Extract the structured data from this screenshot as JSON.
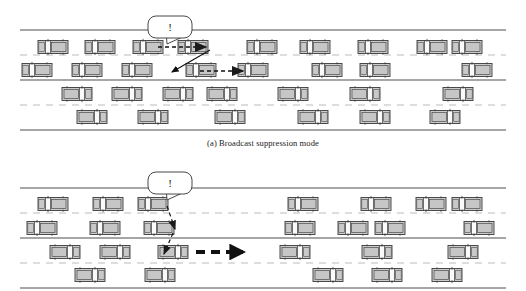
{
  "figure": {
    "background_color": "#ffffff",
    "width": 526,
    "height": 291
  },
  "captions": {
    "panel_a": "(a) Broadcast suppression mode",
    "panel_b": ""
  },
  "bubble": {
    "label": "!",
    "name": "alert-speech-bubble",
    "fill": "#ffffff",
    "stroke": "#333333"
  },
  "colors": {
    "road_line": "#888888",
    "lane_dash": "#bbbbbb",
    "car_body": "#cccccc",
    "car_stroke": "#3a3a3a",
    "car_window": "#f6f6f6",
    "arrow_dark": "#111111",
    "arrow_mid": "#2a2a2a",
    "caption_text": "#1a1a1a"
  },
  "panels": [
    {
      "id": "panel-a",
      "name": "broadcast-suppression-panel",
      "caption": "(a) Broadcast suppression mode",
      "road": {
        "x": 20,
        "y": 30,
        "width": 486,
        "height": 100,
        "lanes": 4
      },
      "lane_y": [
        47,
        70,
        94,
        117
      ],
      "lane_direction": [
        "left",
        "left",
        "right",
        "right"
      ],
      "cars": [
        {
          "lane": 0,
          "x": 38,
          "dir": "left"
        },
        {
          "lane": 0,
          "x": 85,
          "dir": "left"
        },
        {
          "lane": 0,
          "x": 133,
          "dir": "left"
        },
        {
          "lane": 0,
          "x": 178,
          "dir": "left"
        },
        {
          "lane": 0,
          "x": 247,
          "dir": "left"
        },
        {
          "lane": 0,
          "x": 300,
          "dir": "left"
        },
        {
          "lane": 0,
          "x": 358,
          "dir": "left"
        },
        {
          "lane": 0,
          "x": 417,
          "dir": "left"
        },
        {
          "lane": 0,
          "x": 452,
          "dir": "left"
        },
        {
          "lane": 1,
          "x": 22,
          "dir": "left"
        },
        {
          "lane": 1,
          "x": 72,
          "dir": "left"
        },
        {
          "lane": 1,
          "x": 122,
          "dir": "left"
        },
        {
          "lane": 1,
          "x": 186,
          "dir": "left"
        },
        {
          "lane": 1,
          "x": 238,
          "dir": "left"
        },
        {
          "lane": 1,
          "x": 312,
          "dir": "left"
        },
        {
          "lane": 1,
          "x": 360,
          "dir": "left"
        },
        {
          "lane": 1,
          "x": 462,
          "dir": "left"
        },
        {
          "lane": 2,
          "x": 62,
          "dir": "right"
        },
        {
          "lane": 2,
          "x": 112,
          "dir": "right"
        },
        {
          "lane": 2,
          "x": 163,
          "dir": "right"
        },
        {
          "lane": 2,
          "x": 207,
          "dir": "right"
        },
        {
          "lane": 2,
          "x": 278,
          "dir": "right"
        },
        {
          "lane": 2,
          "x": 350,
          "dir": "right"
        },
        {
          "lane": 2,
          "x": 443,
          "dir": "right"
        },
        {
          "lane": 3,
          "x": 77,
          "dir": "right"
        },
        {
          "lane": 3,
          "x": 138,
          "dir": "right"
        },
        {
          "lane": 3,
          "x": 215,
          "dir": "right"
        },
        {
          "lane": 3,
          "x": 298,
          "dir": "right"
        },
        {
          "lane": 3,
          "x": 360,
          "dir": "right"
        },
        {
          "lane": 3,
          "x": 430,
          "dir": "right"
        }
      ],
      "bubble": {
        "x": 148,
        "y": 16,
        "width": 44,
        "height": 22,
        "tail_x": 167,
        "tail_y": 44
      },
      "arrows": [
        {
          "name": "broadcast-arrow-horizontal",
          "type": "dashed",
          "x1": 158,
          "y1": 47,
          "x2": 206,
          "y2": 47,
          "weight": 1.6
        },
        {
          "name": "broadcast-arrow-diagonal",
          "type": "solid",
          "x1": 210,
          "y1": 50,
          "x2": 172,
          "y2": 72,
          "weight": 1.1
        },
        {
          "name": "relay-arrow-horizontal",
          "type": "dashed",
          "x1": 200,
          "y1": 71,
          "x2": 243,
          "y2": 71,
          "weight": 1.6
        }
      ]
    },
    {
      "id": "panel-b",
      "name": "multihop-relay-panel",
      "caption": "",
      "road": {
        "x": 20,
        "y": 188,
        "width": 486,
        "height": 100,
        "lanes": 4
      },
      "lane_y": [
        204,
        228,
        252,
        275
      ],
      "lane_direction": [
        "left",
        "left",
        "right",
        "right"
      ],
      "cars": [
        {
          "lane": 0,
          "x": 38,
          "dir": "left"
        },
        {
          "lane": 0,
          "x": 93,
          "dir": "left"
        },
        {
          "lane": 0,
          "x": 138,
          "dir": "left"
        },
        {
          "lane": 0,
          "x": 288,
          "dir": "left"
        },
        {
          "lane": 0,
          "x": 361,
          "dir": "left"
        },
        {
          "lane": 0,
          "x": 416,
          "dir": "left"
        },
        {
          "lane": 0,
          "x": 452,
          "dir": "left"
        },
        {
          "lane": 1,
          "x": 27,
          "dir": "left"
        },
        {
          "lane": 1,
          "x": 90,
          "dir": "left"
        },
        {
          "lane": 1,
          "x": 144,
          "dir": "left"
        },
        {
          "lane": 1,
          "x": 285,
          "dir": "left"
        },
        {
          "lane": 1,
          "x": 338,
          "dir": "left"
        },
        {
          "lane": 1,
          "x": 375,
          "dir": "left"
        },
        {
          "lane": 1,
          "x": 464,
          "dir": "left"
        },
        {
          "lane": 2,
          "x": 50,
          "dir": "right"
        },
        {
          "lane": 2,
          "x": 100,
          "dir": "right"
        },
        {
          "lane": 2,
          "x": 158,
          "dir": "right"
        },
        {
          "lane": 2,
          "x": 280,
          "dir": "right"
        },
        {
          "lane": 2,
          "x": 362,
          "dir": "right"
        },
        {
          "lane": 2,
          "x": 448,
          "dir": "right"
        },
        {
          "lane": 3,
          "x": 75,
          "dir": "right"
        },
        {
          "lane": 3,
          "x": 145,
          "dir": "right"
        },
        {
          "lane": 3,
          "x": 313,
          "dir": "right"
        },
        {
          "lane": 3,
          "x": 372,
          "dir": "right"
        },
        {
          "lane": 3,
          "x": 432,
          "dir": "right"
        }
      ],
      "bubble": {
        "x": 148,
        "y": 172,
        "width": 44,
        "height": 22,
        "tail_x": 167,
        "tail_y": 200
      },
      "arrows": [
        {
          "name": "relay-arrow-diagonal-1",
          "type": "dashed",
          "x1": 167,
          "y1": 206,
          "x2": 175,
          "y2": 229,
          "weight": 1.2
        },
        {
          "name": "relay-arrow-diagonal-2",
          "type": "dashed",
          "x1": 173,
          "y1": 233,
          "x2": 164,
          "y2": 254,
          "weight": 1.2
        },
        {
          "name": "relay-arrow-heavy",
          "type": "heavy-dashed",
          "x1": 196,
          "y1": 252,
          "x2": 243,
          "y2": 252,
          "weight": 4
        }
      ]
    }
  ]
}
